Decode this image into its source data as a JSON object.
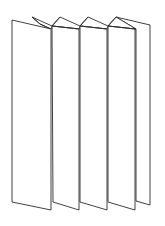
{
  "figure": {
    "title": "Accordion-folded leaflet",
    "panel_count": 5,
    "stroke_color": "#2b2b2b",
    "fill_color": "#ffffff",
    "background": "#ffffff"
  }
}
